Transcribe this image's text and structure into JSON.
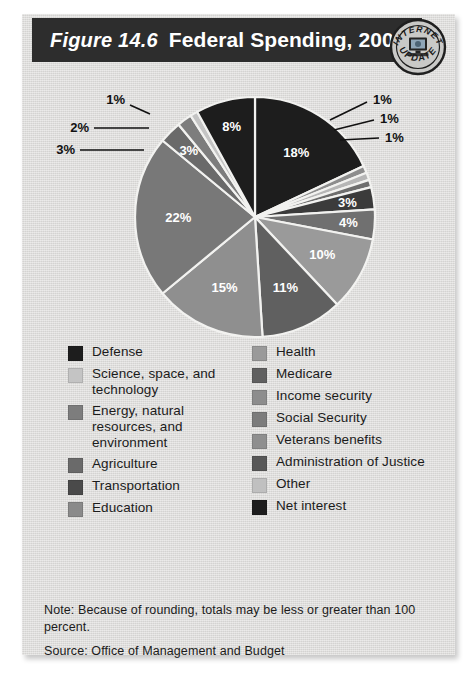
{
  "header": {
    "figure_number": "Figure 14.6",
    "title": "Federal Spending, 2003",
    "badge": {
      "top_text": "INTERNET",
      "bottom_text": "UPDATE",
      "icon": "computer-monitor-icon"
    }
  },
  "footnote": {
    "note": "Note:  Because of rounding, totals may be less or greater than 100 percent.",
    "source": "Source: Office of Management and Budget"
  },
  "colors": {
    "card_background": "#dddcda",
    "title_bar": "#2d2d2d",
    "page_background": "#ffffff",
    "slice_divider": "#f2f2f0",
    "label_light": "#ffffff",
    "label_dark": "#111111"
  },
  "chart_data": {
    "type": "pie",
    "title": "Federal Spending, 2003",
    "unit": "percent",
    "total_label": "100",
    "legend_position": "below",
    "grid": false,
    "categories": [
      "Defense",
      "Administration of Justice",
      "Veterans benefits",
      "Transportation",
      "Agriculture",
      "Income security",
      "Medicare",
      "Health",
      "Social Security",
      "Other",
      "Education",
      "Energy, natural resources, and environment",
      "Science, space, and technology",
      "Net interest"
    ],
    "values": [
      18,
      1,
      1,
      1,
      3,
      4,
      10,
      11,
      15,
      22,
      3,
      2,
      1,
      8
    ],
    "value_labels": [
      "18%",
      "1%",
      "1%",
      "1%",
      "3%",
      "4%",
      "10%",
      "11%",
      "15%",
      "22%",
      "3%",
      "2%",
      "1%",
      "8%"
    ],
    "slice_colors": [
      "#1d1d1d",
      "#8d8d8d",
      "#b6b6b6",
      "#6e6e6e",
      "#3b3b3b",
      "#707070",
      "#9a9a9a",
      "#606060",
      "#8f8f8f",
      "#787878",
      "#6a6a6a",
      "#7d7d7d",
      "#c4c4c4",
      "#1d1d1d"
    ]
  },
  "legend": {
    "left_column": [
      {
        "label": "Defense",
        "color": "#1d1d1d"
      },
      {
        "label": "Science, space, and technology",
        "color": "#c4c4c4"
      },
      {
        "label": "Energy, natural resources, and environment",
        "color": "#7d7d7d"
      },
      {
        "label": "Agriculture",
        "color": "#6a6a6a"
      },
      {
        "label": "Transportation",
        "color": "#4a4a4a"
      },
      {
        "label": "Education",
        "color": "#8a8a8a"
      }
    ],
    "right_column": [
      {
        "label": "Health",
        "color": "#9a9a9a"
      },
      {
        "label": "Medicare",
        "color": "#606060"
      },
      {
        "label": "Income security",
        "color": "#8d8d8d"
      },
      {
        "label": "Social Security",
        "color": "#7c7c7c"
      },
      {
        "label": "Veterans benefits",
        "color": "#8f8f8f"
      },
      {
        "label": "Administration of Justice",
        "color": "#585858"
      },
      {
        "label": "Other",
        "color": "#c0c0c0"
      },
      {
        "label": "Net interest",
        "color": "#1d1d1d"
      }
    ]
  },
  "callouts": {
    "left": [
      "1%",
      "2%",
      "3%"
    ],
    "right": [
      "1%",
      "1%",
      "1%"
    ]
  }
}
